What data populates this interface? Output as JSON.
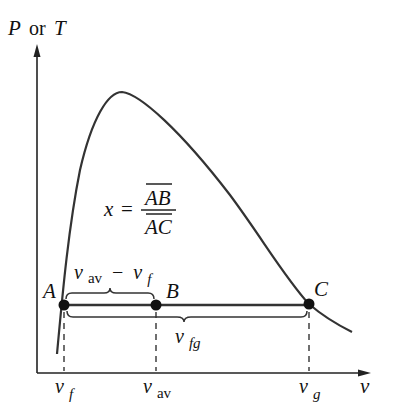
{
  "axes": {
    "y_label_p": "P",
    "y_label_or": "or",
    "y_label_t": "T",
    "x_label": "v"
  },
  "formula": {
    "lhs": "x",
    "eq": "=",
    "numerator": "AB",
    "denominator": "AC"
  },
  "points": {
    "a": "A",
    "b": "B",
    "c": "C"
  },
  "braces": {
    "upper_main": "v",
    "upper_sub": "av",
    "upper_minus": "−",
    "upper_v": "v",
    "upper_f": "f",
    "lower_main": "v",
    "lower_sub": "fg"
  },
  "ticks": {
    "vf_main": "v",
    "vf_sub": "f",
    "vav_main": "v",
    "vav_sub": "av",
    "vg_main": "v",
    "vg_sub": "g"
  },
  "colors": {
    "line": "#2a2a2a",
    "background": "#ffffff"
  }
}
